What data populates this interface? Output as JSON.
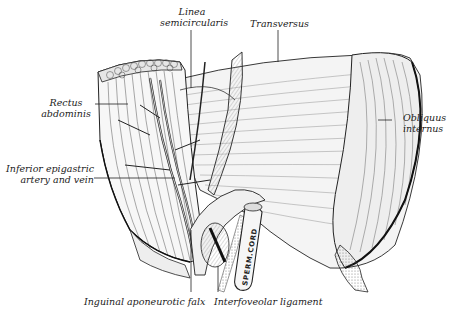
{
  "figure": {
    "labels": {
      "linea_semicircularis": {
        "line1": "Linea",
        "line2": "semicircularis"
      },
      "transversus": "Transversus",
      "rectus_abdominis": {
        "line1": "Rectus",
        "line2": "abdominis"
      },
      "obliquus_internus": {
        "line1": "Obliquus",
        "line2": "internus"
      },
      "inferior_epigastric": {
        "line1": "Inferior epigastric",
        "line2": "artery and vein"
      },
      "inguinal_falx": "Inguinal aponeurotic falx",
      "interfoveolar_ligament": "Interfoveolar ligament",
      "sperm_cord": "SPERM.CORD"
    },
    "colors": {
      "ink": "#222222",
      "background": "#ffffff",
      "shade": "#9a9a9a"
    }
  }
}
